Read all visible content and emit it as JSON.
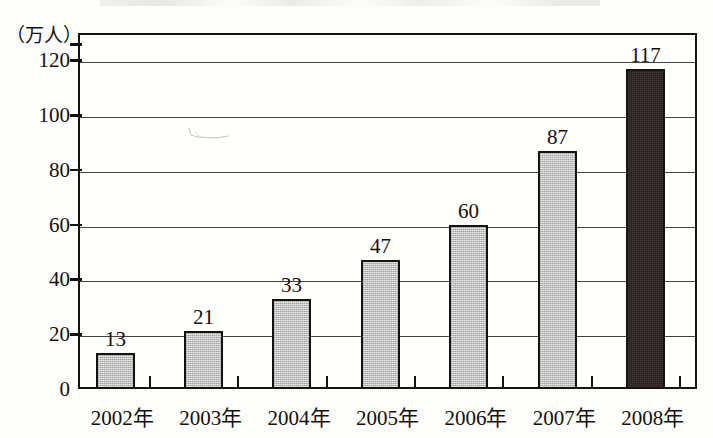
{
  "chart_data": {
    "type": "bar",
    "title": "",
    "subtitle": "",
    "xlabel": "",
    "ylabel": "（万人）",
    "categories": [
      "2002年",
      "2003年",
      "2004年",
      "2005年",
      "2006年",
      "2007年",
      "2008年"
    ],
    "values": [
      13,
      21,
      33,
      47,
      60,
      87,
      117
    ],
    "value_labels": [
      "13",
      "21",
      "33",
      "47",
      "60",
      "87",
      "117"
    ],
    "bar_styles": [
      "gray",
      "gray",
      "gray",
      "gray",
      "gray",
      "gray",
      "dark"
    ],
    "ylim": [
      0,
      130
    ],
    "y_ticks": [
      0,
      20,
      40,
      60,
      80,
      100,
      120
    ],
    "y_tick_labels": [
      "0",
      "20",
      "40",
      "60",
      "80",
      "100",
      "120"
    ],
    "grid": true,
    "grid_axis": "y",
    "legend": null,
    "legend_position": "none",
    "colors": {
      "bar_gray": "#b5b5b5",
      "bar_dark": "#2a2420",
      "bar_outline": "#18120e",
      "axis": "#18120e",
      "gridline": "#4a433c",
      "text": "#15100c",
      "background": "#fffffd"
    }
  },
  "axis": {
    "y_unit_label": "（万人）"
  }
}
